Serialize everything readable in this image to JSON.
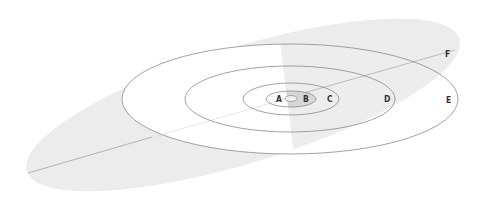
{
  "diagram": {
    "type": "orbital-inclination",
    "colors": {
      "background": "#ffffff",
      "plane_fill": "#ececec",
      "inner_shade": "#d6d6d6",
      "orbit_stroke": "#8a8a8a",
      "plane_line": "#b4b4b4",
      "label": "#333333"
    },
    "labels": {
      "a": "A",
      "b": "B",
      "c": "C",
      "d": "D",
      "e": "E",
      "f": "F"
    }
  }
}
